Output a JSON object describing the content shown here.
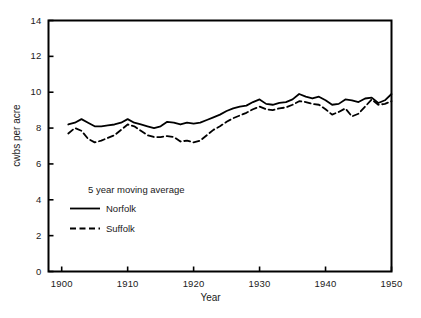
{
  "chart_data": {
    "type": "line",
    "title": "",
    "xlabel": "Year",
    "ylabel": "cwbs per acre",
    "xlim": [
      1898,
      1950
    ],
    "ylim": [
      0,
      14
    ],
    "xticks": [
      "1900",
      "1910",
      "1920",
      "1930",
      "1940",
      "1950"
    ],
    "xtick_values": [
      1900,
      1910,
      1920,
      1930,
      1940,
      1950
    ],
    "yticks": [
      "0",
      "2",
      "4",
      "6",
      "8",
      "10",
      "12",
      "14"
    ],
    "ytick_values": [
      0,
      2,
      4,
      6,
      8,
      10,
      12,
      14
    ],
    "grid": false,
    "legend_position": "lower-left-inside",
    "legend_title": "5 year moving average",
    "x": [
      1901,
      1902,
      1903,
      1904,
      1905,
      1906,
      1907,
      1908,
      1909,
      1910,
      1911,
      1912,
      1913,
      1914,
      1915,
      1916,
      1917,
      1918,
      1919,
      1920,
      1921,
      1922,
      1923,
      1924,
      1925,
      1926,
      1927,
      1928,
      1929,
      1930,
      1931,
      1932,
      1933,
      1934,
      1935,
      1936,
      1937,
      1938,
      1939,
      1940,
      1941,
      1942,
      1943,
      1944,
      1945,
      1946,
      1947,
      1948,
      1949,
      1950
    ],
    "series": [
      {
        "name": "Norfolk",
        "style": "solid",
        "color": "#000000",
        "values": [
          8.2,
          8.3,
          8.5,
          8.3,
          8.1,
          8.1,
          8.15,
          8.2,
          8.3,
          8.5,
          8.3,
          8.2,
          8.1,
          8.0,
          8.1,
          8.35,
          8.3,
          8.2,
          8.3,
          8.25,
          8.3,
          8.45,
          8.6,
          8.75,
          8.95,
          9.1,
          9.2,
          9.25,
          9.45,
          9.6,
          9.35,
          9.3,
          9.4,
          9.45,
          9.6,
          9.9,
          9.75,
          9.65,
          9.75,
          9.55,
          9.3,
          9.35,
          9.6,
          9.55,
          9.45,
          9.65,
          9.7,
          9.4,
          9.55,
          9.9
        ]
      },
      {
        "name": "Suffolk",
        "style": "dashed",
        "color": "#000000",
        "values": [
          7.7,
          8.0,
          7.85,
          7.4,
          7.2,
          7.3,
          7.45,
          7.6,
          7.9,
          8.2,
          8.1,
          7.85,
          7.6,
          7.5,
          7.5,
          7.55,
          7.5,
          7.25,
          7.3,
          7.2,
          7.3,
          7.6,
          7.9,
          8.1,
          8.35,
          8.55,
          8.7,
          8.85,
          9.05,
          9.2,
          9.05,
          9.0,
          9.1,
          9.15,
          9.3,
          9.5,
          9.45,
          9.35,
          9.3,
          9.05,
          8.75,
          8.9,
          9.1,
          8.65,
          8.8,
          9.2,
          9.6,
          9.3,
          9.35,
          9.5
        ]
      }
    ],
    "legend_entries": [
      {
        "label": "Norfolk",
        "style": "solid"
      },
      {
        "label": "Suffolk",
        "style": "dashed"
      }
    ]
  }
}
